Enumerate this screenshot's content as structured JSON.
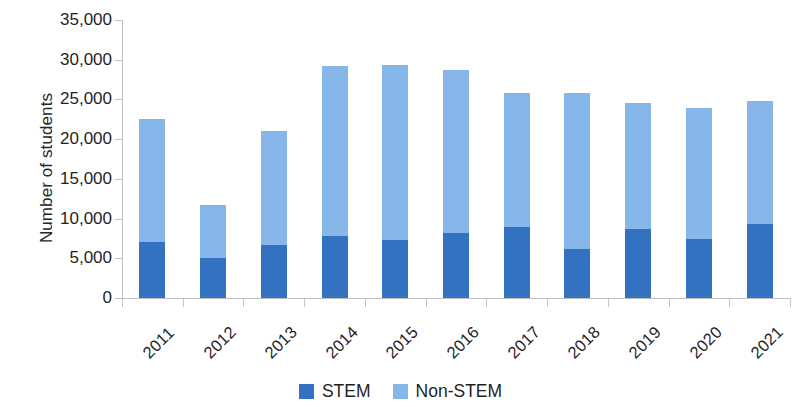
{
  "chart_data": {
    "type": "bar",
    "subtype": "stacked-vertical",
    "title": "",
    "subtitle": "",
    "xlabel": "",
    "ylabel": "Number of students",
    "categories": [
      "2011",
      "2012",
      "2013",
      "2014",
      "2015",
      "2016",
      "2017",
      "2018",
      "2019",
      "2020",
      "2021"
    ],
    "series": [
      {
        "name": "STEM",
        "color": "#3272c0",
        "values": [
          7000,
          5100,
          6700,
          7800,
          7300,
          8200,
          8900,
          6200,
          8700,
          7400,
          9300
        ]
      },
      {
        "name": "Non-STEM",
        "color": "#86b7e8",
        "values": [
          15500,
          6600,
          14300,
          21400,
          22000,
          20500,
          16900,
          19600,
          15800,
          16500,
          15500
        ]
      }
    ],
    "totals": [
      22500,
      11700,
      21000,
      29200,
      29300,
      28700,
      25800,
      25800,
      24500,
      23900,
      24800
    ],
    "ylim": [
      0,
      35000
    ],
    "ytick_values": [
      0,
      5000,
      10000,
      15000,
      20000,
      25000,
      30000,
      35000
    ],
    "ytick_labels": [
      "0",
      "5,000",
      "10,000",
      "15,000",
      "20,000",
      "25,000",
      "30,000",
      "35,000"
    ],
    "grid": false,
    "legend_position": "bottom-center",
    "xtick_label_rotation": -45
  },
  "legend": {
    "items": [
      {
        "label": "STEM",
        "color": "#3272c0"
      },
      {
        "label": "Non-STEM",
        "color": "#86b7e8"
      }
    ]
  },
  "axes": {
    "y_title": "Number of students"
  },
  "colors": {
    "stem": "#3272c0",
    "non_stem": "#86b7e8",
    "axis": "#bfbfbf",
    "text": "#1f1f1f",
    "background": "#ffffff"
  }
}
